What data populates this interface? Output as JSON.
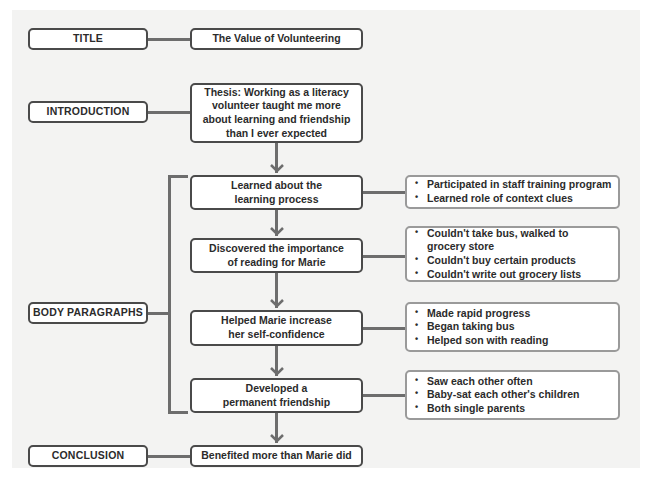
{
  "diagram": {
    "sections": {
      "title": {
        "label": "TITLE",
        "content": "The Value of Volunteering"
      },
      "introduction": {
        "label": "INTRODUCTION",
        "content": "Thesis: Working as a literacy volunteer taught me more about learning and friendship than I ever expected"
      },
      "body": {
        "label": "BODY PARAGRAPHS",
        "paragraphs": [
          {
            "topic": "Learned about the learning process",
            "details": [
              "Participated in staff training program",
              "Learned role of context clues"
            ]
          },
          {
            "topic": "Discovered the importance of reading for Marie",
            "details": [
              "Couldn't take bus, walked to grocery store",
              "Couldn't buy certain products",
              "Couldn't write out grocery lists"
            ]
          },
          {
            "topic": "Helped Marie increase her self-confidence",
            "details": [
              "Made rapid progress",
              "Began taking bus",
              "Helped son with reading"
            ]
          },
          {
            "topic": "Developed a permanent friendship",
            "details": [
              "Saw each other often",
              "Baby-sat each other's children",
              "Both single parents"
            ]
          }
        ]
      },
      "conclusion": {
        "label": "CONCLUSION",
        "content": "Benefited more than Marie did"
      }
    },
    "colors": {
      "border_dark": "#4a4a4a",
      "border_light": "#9a9a9a",
      "connector": "#6d6d6d",
      "panel_bg": "#f3f3f2",
      "text": "#2b2b2b"
    }
  }
}
